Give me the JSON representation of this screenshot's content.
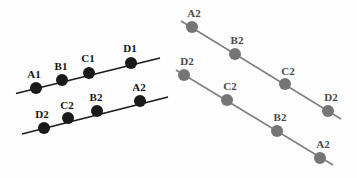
{
  "figure": {
    "width": 357,
    "height": 178,
    "background_color": "#fdfdfd"
  },
  "chart_data": {
    "type": "scatter",
    "title": "",
    "xlabel": "",
    "ylabel": "",
    "xlim": [
      0,
      357
    ],
    "ylim": [
      178,
      0
    ],
    "grid": false,
    "legend": "none",
    "groups": [
      {
        "name": "left-diagram",
        "dot_color": "#1a1a1a",
        "line_color": "#1a1a1a",
        "dot_radius": 6,
        "line_width": 1.6,
        "series": [
          {
            "name": "left-upper-line",
            "line": {
              "x1": 16,
              "y1": 93.5,
              "x2": 160,
              "y2": 58
            },
            "points": [
              {
                "label": "A1",
                "x": 36,
                "y": 88,
                "label_x": 34,
                "label_y": 80
              },
              {
                "label": "B1",
                "x": 62,
                "y": 80,
                "label_x": 61,
                "label_y": 72
              },
              {
                "label": "C1",
                "x": 89,
                "y": 73,
                "label_x": 88,
                "label_y": 64
              },
              {
                "label": "D1",
                "x": 131,
                "y": 63,
                "label_x": 130,
                "label_y": 54
              }
            ]
          },
          {
            "name": "left-lower-line",
            "line": {
              "x1": 22,
              "y1": 134,
              "x2": 168,
              "y2": 97
            },
            "points": [
              {
                "label": "D2",
                "x": 44,
                "y": 128,
                "label_x": 42,
                "label_y": 120
              },
              {
                "label": "C2",
                "x": 68,
                "y": 118,
                "label_x": 67,
                "label_y": 111
              },
              {
                "label": "B2",
                "x": 97,
                "y": 111,
                "label_x": 96,
                "label_y": 103
              },
              {
                "label": "A2",
                "x": 140,
                "y": 101,
                "label_x": 139,
                "label_y": 93
              }
            ]
          }
        ]
      },
      {
        "name": "right-diagram",
        "dot_color": "#757575",
        "line_color": "#808080",
        "dot_radius": 6,
        "line_width": 1.6,
        "series": [
          {
            "name": "right-upper-line",
            "line": {
              "x1": 181,
              "y1": 21,
              "x2": 341,
              "y2": 119
            },
            "points": [
              {
                "label": "A2",
                "x": 192,
                "y": 27,
                "label_x": 194,
                "label_y": 19
              },
              {
                "label": "B2",
                "x": 235,
                "y": 54,
                "label_x": 237,
                "label_y": 46
              },
              {
                "label": "C2",
                "x": 285,
                "y": 84,
                "label_x": 288,
                "label_y": 77
              },
              {
                "label": "D2",
                "x": 328,
                "y": 111,
                "label_x": 331,
                "label_y": 103
              }
            ]
          },
          {
            "name": "right-lower-line",
            "line": {
              "x1": 176,
              "y1": 70,
              "x2": 333,
              "y2": 165
            },
            "points": [
              {
                "label": "D2",
                "x": 184,
                "y": 75,
                "label_x": 187,
                "label_y": 67
              },
              {
                "label": "C2",
                "x": 227,
                "y": 100,
                "label_x": 230,
                "label_y": 92
              },
              {
                "label": "B2",
                "x": 277,
                "y": 131,
                "label_x": 280,
                "label_y": 123
              },
              {
                "label": "A2",
                "x": 320,
                "y": 158,
                "label_x": 323,
                "label_y": 150
              }
            ]
          }
        ]
      }
    ]
  }
}
